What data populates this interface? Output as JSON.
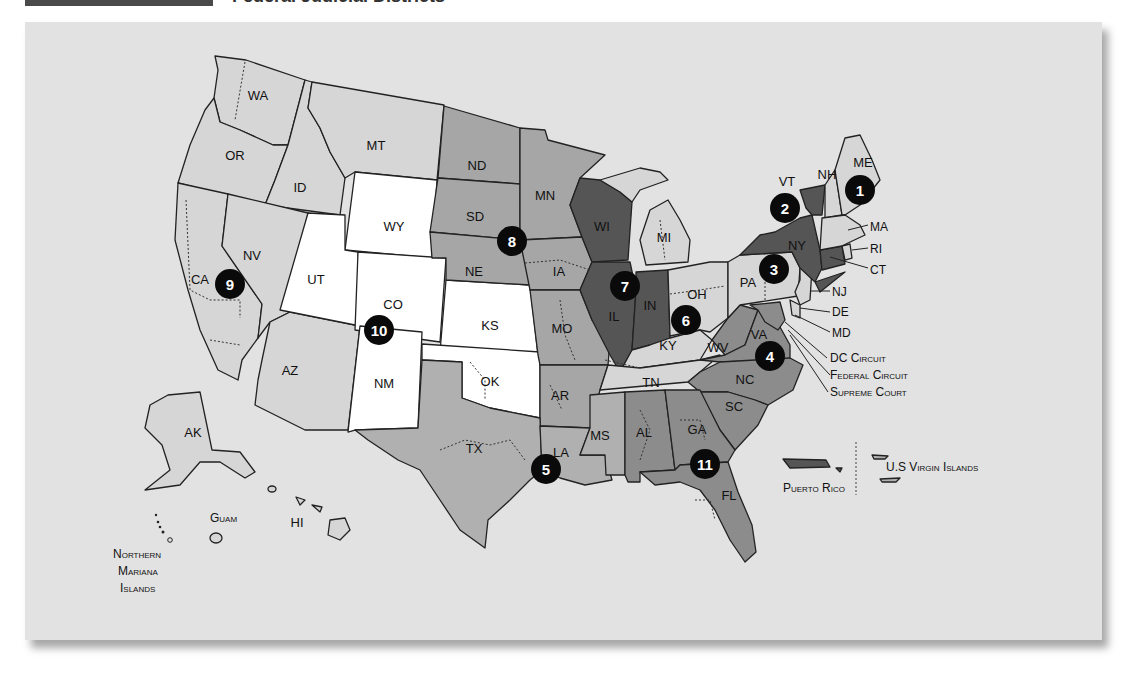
{
  "header": {
    "title": "Federal Judicial Districts"
  },
  "map": {
    "title": "U.S. Federal Judicial Circuits and Districts",
    "colors": {
      "background": "#e2e2e2",
      "light": "#d6d6d6",
      "medium": "#b0b0b0",
      "medium_alt": "#a6a6a6",
      "dark_medium": "#8c8c8c",
      "dark": "#555555",
      "white": "#ffffff",
      "circuit_marker": "#0a0a0a"
    },
    "states": {
      "WA": "WA",
      "OR": "OR",
      "ID": "ID",
      "MT": "MT",
      "WY": "WY",
      "CA": "CA",
      "NV": "NV",
      "UT": "UT",
      "CO": "CO",
      "AZ": "AZ",
      "NM": "NM",
      "ND": "ND",
      "SD": "SD",
      "NE": "NE",
      "KS": "KS",
      "OK": "OK",
      "TX": "TX",
      "MN": "MN",
      "IA": "IA",
      "MO": "MO",
      "AR": "AR",
      "LA": "LA",
      "MS": "MS",
      "WI": "WI",
      "IL": "IL",
      "IN": "IN",
      "MI": "MI",
      "OH": "OH",
      "KY": "KY",
      "TN": "TN",
      "AL": "AL",
      "GA": "GA",
      "FL": "FL",
      "SC": "SC",
      "NC": "NC",
      "VA": "VA",
      "WV": "WV",
      "PA": "PA",
      "NY": "NY",
      "VT": "VT",
      "NH": "NH",
      "ME": "ME",
      "MA": "MA",
      "RI": "RI",
      "CT": "CT",
      "NJ": "NJ",
      "DE": "DE",
      "MD": "MD",
      "AK": "AK",
      "HI": "HI"
    },
    "callouts": {
      "dc_circuit": "DC Circuit",
      "federal_circuit": "Federal Circuit",
      "supreme_court": "Supreme Court"
    },
    "territories": {
      "puerto_rico": "Puerto Rico",
      "virgin_islands": "U.S Virgin Islands",
      "guam": "Guam",
      "northern_mariana_1": "Northern",
      "northern_mariana_2": "Mariana",
      "northern_mariana_3": "Islands"
    },
    "circuits": [
      {
        "number": "1",
        "states": [
          "ME",
          "NH",
          "MA",
          "RI"
        ],
        "shade": "light"
      },
      {
        "number": "2",
        "states": [
          "NY",
          "VT",
          "CT"
        ],
        "shade": "dark"
      },
      {
        "number": "3",
        "states": [
          "PA",
          "NJ",
          "DE"
        ],
        "shade": "light"
      },
      {
        "number": "4",
        "states": [
          "VA",
          "WV",
          "NC",
          "SC",
          "MD"
        ],
        "shade": "dark_medium"
      },
      {
        "number": "5",
        "states": [
          "TX",
          "LA",
          "MS"
        ],
        "shade": "medium"
      },
      {
        "number": "6",
        "states": [
          "OH",
          "MI",
          "KY",
          "TN"
        ],
        "shade": "light"
      },
      {
        "number": "7",
        "states": [
          "WI",
          "IL",
          "IN"
        ],
        "shade": "dark"
      },
      {
        "number": "8",
        "states": [
          "ND",
          "SD",
          "NE",
          "MN",
          "IA",
          "MO",
          "AR"
        ],
        "shade": "medium_alt"
      },
      {
        "number": "9",
        "states": [
          "WA",
          "OR",
          "ID",
          "MT",
          "CA",
          "NV",
          "AZ",
          "AK",
          "HI"
        ],
        "shade": "light"
      },
      {
        "number": "10",
        "states": [
          "WY",
          "UT",
          "CO",
          "KS",
          "OK",
          "NM"
        ],
        "shade": "white"
      },
      {
        "number": "11",
        "states": [
          "AL",
          "GA",
          "FL"
        ],
        "shade": "dark_medium"
      }
    ]
  }
}
